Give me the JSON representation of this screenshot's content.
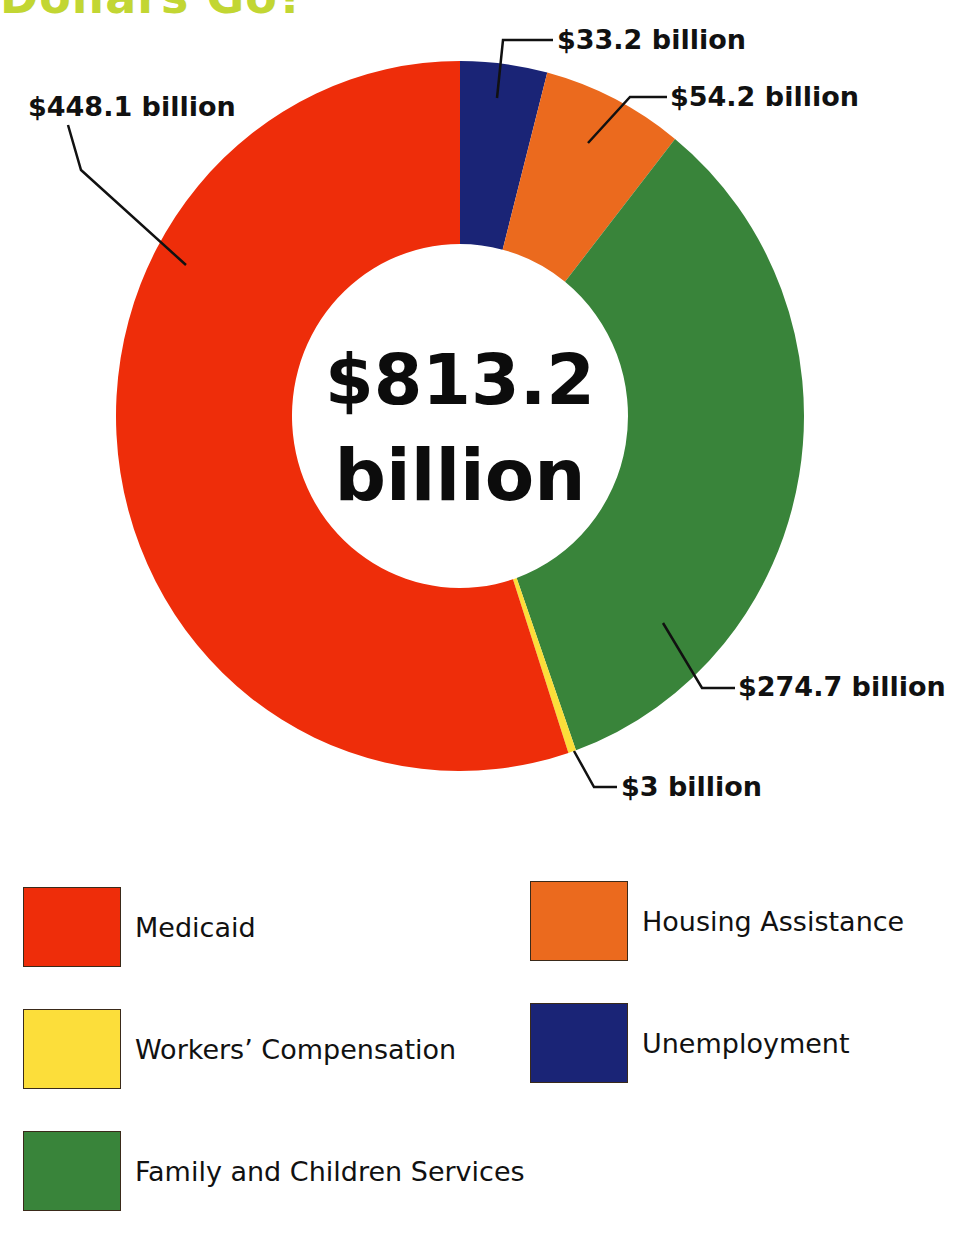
{
  "heading": {
    "text": "Dollars Go?",
    "color": "#c2d633"
  },
  "center": {
    "amount": "$813.2",
    "unit": "billion"
  },
  "callouts": {
    "unemployment": "$33.2 billion",
    "housing": "$54.2 billion",
    "medicaid": "$448.1 billion",
    "family": "$274.7 billion",
    "workers": "$3 billion"
  },
  "legend": [
    {
      "label": "Medicaid",
      "color": "#ee2d0a"
    },
    {
      "label": "Workers’ Compensation",
      "color": "#fcde3a"
    },
    {
      "label": "Family and Children Services",
      "color": "#39843a"
    },
    {
      "label": "Housing Assistance",
      "color": "#eb6a1e"
    },
    {
      "label": "Unemployment",
      "color": "#1a2476"
    }
  ],
  "chart_data": {
    "type": "pie",
    "subtype": "donut",
    "title": "",
    "total_label": "$813.2 billion",
    "unit": "billion USD",
    "categories": [
      "Unemployment",
      "Housing Assistance",
      "Family and Children Services",
      "Workers' Compensation",
      "Medicaid"
    ],
    "values": [
      33.2,
      54.2,
      274.7,
      3,
      448.1
    ],
    "value_labels": [
      "$33.2 billion",
      "$54.2 billion",
      "$274.7 billion",
      "$3 billion",
      "$448.1 billion"
    ],
    "colors": [
      "#1a2476",
      "#eb6a1e",
      "#39843a",
      "#fcde3a",
      "#ee2d0a"
    ],
    "start_angle": "12 o'clock, clockwise",
    "legend_position": "bottom"
  }
}
